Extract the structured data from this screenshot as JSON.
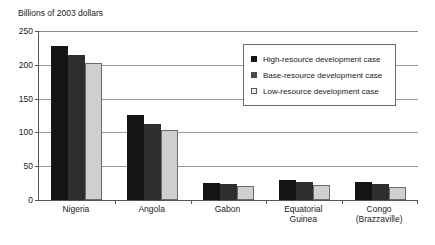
{
  "chart_data": {
    "type": "bar",
    "title": "Billions of 2003 dollars",
    "xlabel": "",
    "ylabel": "Billions of 2003 dollars",
    "ylim": [
      0,
      250
    ],
    "yticks": [
      0,
      50,
      100,
      150,
      200,
      250
    ],
    "ytick_labels": [
      "0",
      "50",
      "100",
      "150",
      "200",
      "250"
    ],
    "grid": true,
    "legend_position": "upper right inside plot",
    "categories": [
      "Nigeria",
      "Angola",
      "Gabon",
      "Equatorial Guinea",
      "Congo (Brazzaville)"
    ],
    "category_lines": [
      [
        "Nigeria"
      ],
      [
        "Angola"
      ],
      [
        "Gabon"
      ],
      [
        "Equatorial",
        "Guinea"
      ],
      [
        "Congo",
        "(Brazzaville)"
      ]
    ],
    "series": [
      {
        "name": "High-resource development case",
        "color": "#141414",
        "values": [
          228,
          126,
          25,
          29,
          27
        ]
      },
      {
        "name": "Base-resource development case",
        "color": "#2e2e2e",
        "values": [
          215,
          113,
          23,
          26,
          23
        ]
      },
      {
        "name": "Low-resource development case",
        "color": "#cfcfcf",
        "values": [
          202,
          103,
          20,
          22,
          19
        ]
      }
    ]
  },
  "axis": {
    "title": "Billions of 2003 dollars"
  },
  "legend": {
    "items": [
      {
        "label": "High-resource development case",
        "swatch": "legend-swatch-high"
      },
      {
        "label": "Base-resource development case",
        "swatch": "legend-swatch-base"
      },
      {
        "label": "Low-resource development case",
        "swatch": "legend-swatch-low"
      }
    ]
  }
}
